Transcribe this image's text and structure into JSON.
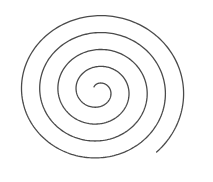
{
  "image": {
    "subject": "archimedean-spiral",
    "background_color": "#ffffff",
    "stroke_color": "#4a4a4a",
    "stroke_width": 1.3,
    "center": [
      98,
      91
    ],
    "turns": 4.5
  }
}
